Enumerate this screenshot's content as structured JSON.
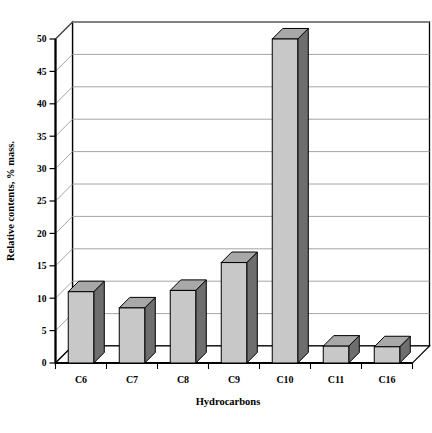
{
  "chart_data": {
    "type": "bar",
    "title": "",
    "subtitle": "",
    "xlabel": "Hydrocarbons",
    "ylabel": "Relative contents, % mass.",
    "categories": [
      "C6",
      "C7",
      "C8",
      "C9",
      "C10",
      "C11",
      "C16"
    ],
    "values": [
      11.0,
      8.5,
      11.2,
      15.5,
      50.0,
      2.6,
      2.5
    ],
    "series": [
      {
        "name": "Relative contents",
        "values": [
          11.0,
          8.5,
          11.2,
          15.5,
          50.0,
          2.6,
          2.5
        ]
      }
    ],
    "ylim": [
      0,
      50
    ],
    "ytick_values": [
      0,
      5,
      10,
      15,
      20,
      25,
      30,
      35,
      40,
      45,
      50
    ],
    "ytick_labels": [
      "0",
      "5",
      "10",
      "15",
      "20",
      "25",
      "30",
      "35",
      "40",
      "45",
      "50"
    ],
    "grid": true,
    "grid_axis": "y",
    "legend": false,
    "legend_position": "none",
    "style": "3d-column",
    "colors": {
      "bar_front": "#c8c8c8",
      "bar_side": "#6e6e6e",
      "bar_top": "#a8a8a8",
      "bar_outline": "#000000",
      "wall_back": "#ffffff",
      "wall_left": "#ffffff",
      "floor": "#ffffff",
      "gridline": "#9a9a9a",
      "axis": "#000000",
      "text": "#000000",
      "background": "#ffffff"
    }
  },
  "axes": {
    "y_axis_name": "value-axis",
    "x_axis_name": "category-axis"
  }
}
